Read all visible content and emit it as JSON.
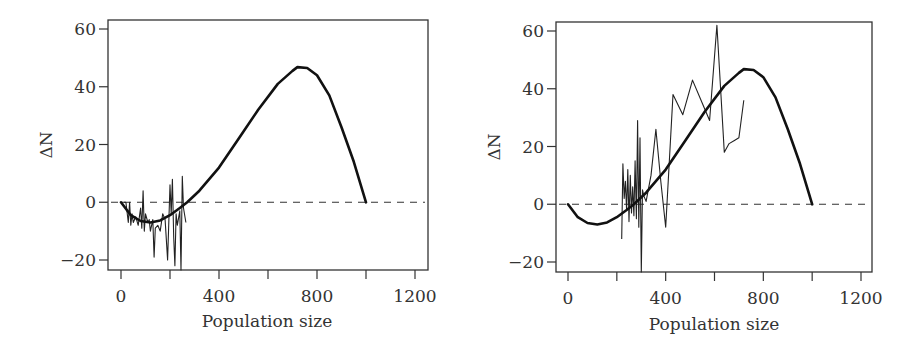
{
  "chart_data": [
    {
      "type": "line",
      "panel": "left",
      "title": "",
      "xlabel": "Population size",
      "ylabel": "ΔN",
      "xlim": [
        -60,
        1250
      ],
      "ylim": [
        -24,
        62
      ],
      "xticks": [
        0,
        400,
        800,
        1200
      ],
      "xminor": [
        200,
        600,
        1000
      ],
      "yticks": [
        -20,
        0,
        20,
        40,
        60
      ],
      "grid": false,
      "legend": null,
      "reference_line": {
        "y": 0,
        "style": "dashed"
      },
      "series": [
        {
          "name": "model curve",
          "style": "thick",
          "x": [
            0,
            40,
            80,
            120,
            160,
            200,
            240,
            270,
            320,
            400,
            480,
            560,
            640,
            700,
            720,
            760,
            800,
            850,
            900,
            950,
            1000
          ],
          "y": [
            0,
            -4.5,
            -6.5,
            -7,
            -6.3,
            -4.5,
            -2,
            0,
            4,
            12,
            22,
            32,
            41,
            45.5,
            46.8,
            46.5,
            44,
            37,
            26,
            14,
            0
          ]
        },
        {
          "name": "observed ΔN",
          "style": "thin",
          "x": [
            0,
            20,
            30,
            35,
            40,
            45,
            50,
            60,
            70,
            80,
            85,
            90,
            95,
            100,
            110,
            115,
            120,
            130,
            135,
            140,
            150,
            160,
            170,
            180,
            190,
            200,
            205,
            210,
            215,
            220,
            225,
            230,
            240,
            245,
            250,
            255,
            265
          ],
          "y": [
            0,
            0,
            -7,
            0,
            -8,
            -4,
            -7,
            -5,
            -8,
            -2,
            -9,
            4,
            -10,
            -4,
            -7,
            -6,
            -10,
            -6,
            -19,
            -9,
            -8,
            -10,
            -4,
            -6,
            -20,
            6,
            -4,
            8,
            -12,
            -22,
            -4,
            -8,
            -3,
            -25,
            9,
            -2,
            -7
          ]
        }
      ]
    },
    {
      "type": "line",
      "panel": "right",
      "title": "",
      "xlabel": "Population size",
      "ylabel": "ΔN",
      "xlim": [
        -60,
        1250
      ],
      "ylim": [
        -24,
        62
      ],
      "xticks": [
        0,
        400,
        800,
        1200
      ],
      "xminor": [
        200,
        600,
        1000
      ],
      "yticks": [
        -20,
        0,
        20,
        40,
        60
      ],
      "grid": false,
      "legend": null,
      "reference_line": {
        "y": 0,
        "style": "dashed"
      },
      "series": [
        {
          "name": "model curve",
          "style": "thick",
          "x": [
            0,
            40,
            80,
            120,
            160,
            200,
            240,
            270,
            320,
            400,
            480,
            560,
            640,
            700,
            720,
            760,
            800,
            850,
            900,
            950,
            1000
          ],
          "y": [
            0,
            -4.5,
            -6.5,
            -7,
            -6.3,
            -4.5,
            -2,
            0,
            4,
            12,
            22,
            32,
            41,
            45.5,
            46.8,
            46.5,
            44,
            37,
            26,
            14,
            0
          ]
        },
        {
          "name": "observed ΔN",
          "style": "thin",
          "x": [
            220,
            225,
            230,
            235,
            240,
            245,
            250,
            255,
            260,
            265,
            270,
            275,
            280,
            285,
            290,
            295,
            300,
            305,
            310,
            320,
            340,
            360,
            380,
            400,
            430,
            470,
            510,
            550,
            580,
            610,
            640,
            660,
            680,
            700,
            720
          ],
          "y": [
            -12,
            14,
            2,
            8,
            -2,
            12,
            -6,
            10,
            -3,
            6,
            -4,
            15,
            -5,
            29,
            -8,
            23,
            -25,
            5,
            3,
            1,
            10,
            26,
            8,
            -8,
            38,
            31,
            43,
            35,
            29,
            62,
            18,
            21,
            22,
            23,
            36
          ]
        }
      ]
    }
  ],
  "panels": {
    "left": {
      "ylabel": "ΔN",
      "xlabel": "Population size",
      "xtick_labels": [
        "0",
        "400",
        "800",
        "1200"
      ],
      "ytick_labels": [
        "60",
        "40",
        "20",
        "0",
        "−20"
      ]
    },
    "right": {
      "ylabel": "ΔN",
      "xlabel": "Population size",
      "xtick_labels": [
        "0",
        "400",
        "800",
        "1200"
      ],
      "ytick_labels": [
        "60",
        "40",
        "20",
        "0",
        "−20"
      ]
    }
  },
  "colors": {
    "axis": "#333333",
    "line": "#111111",
    "background": "#ffffff"
  }
}
